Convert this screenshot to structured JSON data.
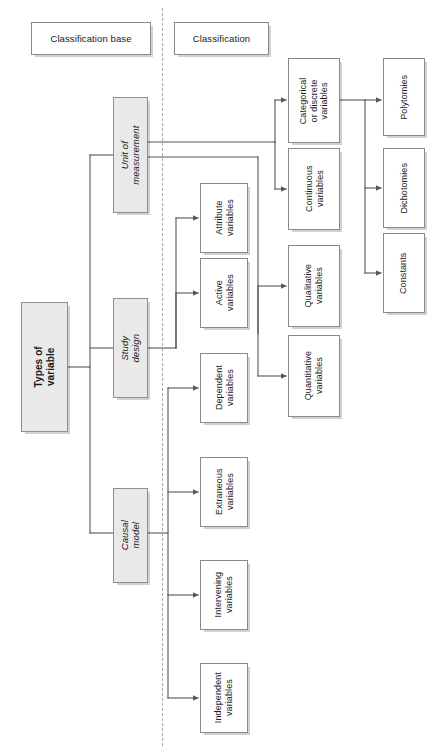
{
  "diagram": {
    "title": "Types of variable",
    "orientation": "rotated-90",
    "columns": {
      "classification_base": "Classification base",
      "classification": "Classification"
    },
    "root": {
      "label": "Types of variable"
    },
    "bases": [
      {
        "id": "unit-of-measurement",
        "label": "Unit of measurement"
      },
      {
        "id": "study-design",
        "label": "Study design"
      },
      {
        "id": "causal-model",
        "label": "Causal model"
      }
    ],
    "classifications": [
      {
        "id": "categorical-or-discrete-variables",
        "label": "Categorical\nor discrete\nvariables",
        "parent": "unit-of-measurement"
      },
      {
        "id": "continuous-variables",
        "label": "Continuous\nvariables",
        "parent": "unit-of-measurement"
      },
      {
        "id": "qualitative-variables",
        "label": "Qualitative\nvariables",
        "parent": "unit-of-measurement"
      },
      {
        "id": "quantitative-variables",
        "label": "Quantitative\nvariables",
        "parent": "unit-of-measurement"
      },
      {
        "id": "attribute-variables",
        "label": "Attribute\nvariables",
        "parent": "study-design"
      },
      {
        "id": "active-variables",
        "label": "Active\nvariables",
        "parent": "study-design"
      },
      {
        "id": "dependent-variables",
        "label": "Dependent\nvariables",
        "parent": "causal-model"
      },
      {
        "id": "extraneous-variables",
        "label": "Extraneous\nvariables",
        "parent": "causal-model"
      },
      {
        "id": "intervening-variables",
        "label": "Intervening\nvariables",
        "parent": "causal-model"
      },
      {
        "id": "independent-variables",
        "label": "Independent\nvariables",
        "parent": "causal-model"
      }
    ],
    "subtypes": [
      {
        "id": "polytomies",
        "label": "Polytomies",
        "parent": "categorical-or-discrete-variables"
      },
      {
        "id": "dichotomies",
        "label": "Dichotomies",
        "parent": "categorical-or-discrete-variables"
      },
      {
        "id": "constants",
        "label": "Constants",
        "parent": "categorical-or-discrete-variables"
      }
    ],
    "colors": {
      "box_fill": "#ffffff",
      "shaded_fill": "#e9e9e9",
      "border": "#8a8a8a",
      "line": "#555555",
      "divider": "#9a9aa8",
      "text": "#1a1a1a"
    }
  }
}
